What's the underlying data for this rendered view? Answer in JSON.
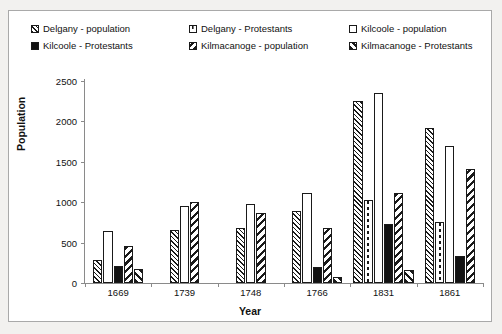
{
  "chart_data": {
    "type": "bar",
    "title": "",
    "xlabel": "Year",
    "ylabel": "Population",
    "categories": [
      "1669",
      "1739",
      "1748",
      "1766",
      "1831",
      "1861"
    ],
    "ylim": [
      0,
      2500
    ],
    "yticks": [
      0,
      500,
      1000,
      1500,
      2000,
      2500
    ],
    "grid": false,
    "legend_position": "top",
    "series": [
      {
        "name": "Delgany - population",
        "pattern": "backslash-hatch-fine",
        "values": [
          290,
          660,
          675,
          890,
          2250,
          1920
        ]
      },
      {
        "name": "Delgany - Protestants",
        "pattern": "white-dashed-line",
        "values": [
          null,
          null,
          null,
          null,
          1030,
          750
        ]
      },
      {
        "name": "Kilcoole - population",
        "pattern": "solid-white",
        "values": [
          640,
          950,
          980,
          1120,
          2350,
          1700
        ]
      },
      {
        "name": "Kilcoole - Protestants",
        "pattern": "solid-black",
        "values": [
          205,
          null,
          null,
          195,
          725,
          330
        ]
      },
      {
        "name": "Kilmacanoge - population",
        "pattern": "forwardslash-hatch",
        "values": [
          455,
          1000,
          865,
          675,
          1110,
          1410
        ]
      },
      {
        "name": "Kilmacanoge - Protestants",
        "pattern": "backslash-hatch-bold",
        "values": [
          170,
          null,
          null,
          70,
          165,
          null
        ]
      }
    ]
  },
  "legend": {
    "items": [
      {
        "label": "Delgany - population"
      },
      {
        "label": "Delgany - Protestants"
      },
      {
        "label": "Kilcoole - population"
      },
      {
        "label": "Kilcoole - Protestants"
      },
      {
        "label": "Kilmacanoge - population"
      },
      {
        "label": "Kilmacanoge - Protestants"
      }
    ]
  },
  "colors": {
    "ink": "#1a1a1a",
    "axis": "#8a8a8a",
    "plot_background": "#ffffff",
    "page_background": "#f2f1ef"
  }
}
